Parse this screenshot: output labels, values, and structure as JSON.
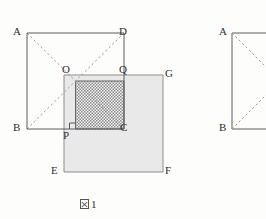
{
  "figure": {
    "caption_glyph": "図",
    "caption_number": "1",
    "caption_full": "図1",
    "background_color": "#fdfdfc",
    "stroke_color": "#555555",
    "dash_color": "#8a8a8a",
    "hatch_color": "#6e6e6e",
    "gray_fill": "#e6e6e6",
    "label_color": "#2e2e2e"
  },
  "diagram1": {
    "name": "figure-1-main",
    "square_abcd": {
      "label": "ABCD",
      "vertices": [
        {
          "id": "A",
          "label": "A",
          "x": 27,
          "y": 33
        },
        {
          "id": "D",
          "label": "D",
          "x": 124,
          "y": 33
        },
        {
          "id": "C",
          "label": "C",
          "x": 124,
          "y": 129
        },
        {
          "id": "B",
          "label": "B",
          "x": 27,
          "y": 129
        }
      ],
      "fill": "none",
      "stroke": "#555555"
    },
    "diagonals": [
      {
        "id": "AC",
        "from": "A",
        "to": "C",
        "style": "dashed"
      },
      {
        "id": "BD",
        "from": "B",
        "to": "D",
        "style": "dashed"
      }
    ],
    "center_point": {
      "id": "O",
      "label": "O",
      "x": 75.5,
      "y": 81
    },
    "hatched_square_oqcp": {
      "label": "OQCP",
      "vertices": [
        {
          "id": "O",
          "label": "O",
          "x": 75.5,
          "y": 81
        },
        {
          "id": "Q",
          "label": "Q",
          "x": 124,
          "y": 81
        },
        {
          "id": "C",
          "label": "C",
          "x": 124,
          "y": 129
        },
        {
          "id": "P",
          "label": "P",
          "x": 75.5,
          "y": 129
        }
      ],
      "fill_pattern": "diagonal-hatch",
      "has_diagonal": true,
      "diagonal_from": "O",
      "diagonal_to": "C"
    },
    "gray_square_pefg": {
      "label": "PEFG",
      "vertices": [
        {
          "id": "G",
          "label": "G",
          "x": 163,
          "y": 75
        },
        {
          "id": "F",
          "label": "F",
          "x": 163,
          "y": 172
        },
        {
          "id": "E",
          "label": "E",
          "x": 64,
          "y": 172
        },
        {
          "id": "P2",
          "label": "",
          "x": 64,
          "y": 75
        }
      ],
      "fill": "#e9e9e9",
      "stroke": "#7a7a7a"
    },
    "right_angle_mark": {
      "at": "P",
      "x": 75.5,
      "y": 129,
      "size": 6,
      "label": "right-angle"
    },
    "vertex_labels": [
      {
        "id": "A",
        "text": "A",
        "left": 13,
        "top": 26
      },
      {
        "id": "D",
        "text": "D",
        "left": 119,
        "top": 26
      },
      {
        "id": "O",
        "text": "O",
        "left": 62,
        "top": 64
      },
      {
        "id": "Q",
        "text": "Q",
        "left": 119,
        "top": 64
      },
      {
        "id": "G",
        "text": "G",
        "left": 165,
        "top": 68
      },
      {
        "id": "B",
        "text": "B",
        "left": 13,
        "top": 122
      },
      {
        "id": "P",
        "text": "P",
        "left": 63,
        "top": 130
      },
      {
        "id": "C",
        "text": "C",
        "left": 120,
        "top": 122
      },
      {
        "id": "E",
        "text": "E",
        "left": 51,
        "top": 165
      },
      {
        "id": "F",
        "text": "F",
        "left": 165,
        "top": 165
      }
    ]
  },
  "diagram2": {
    "name": "figure-2-partial",
    "note": "second figure, cropped at right edge of image",
    "square_partial": {
      "vertices": [
        {
          "id": "A2",
          "label": "A",
          "x": 232,
          "y": 33
        },
        {
          "id": "B2",
          "label": "B",
          "x": 232,
          "y": 129
        }
      ],
      "right_edge_cut_at_x": 266
    },
    "diagonals": [
      {
        "id": "A2-out",
        "from": "A2",
        "style": "dashed",
        "direction": "down-right"
      },
      {
        "id": "B2-out",
        "from": "B2",
        "style": "dashed",
        "direction": "up-right"
      }
    ],
    "vertex_labels": [
      {
        "id": "A2",
        "text": "A",
        "left": 219,
        "top": 26
      },
      {
        "id": "B2",
        "text": "B",
        "left": 219,
        "top": 122
      }
    ]
  },
  "caption": {
    "text": "図1",
    "number": "1",
    "left": 80,
    "top": 198
  }
}
